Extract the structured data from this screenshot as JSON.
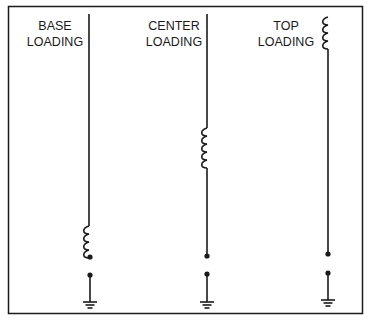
{
  "diagram": {
    "type": "antenna-loading-comparison",
    "colors": {
      "ink": "#1a1a1a",
      "background": "#ffffff"
    },
    "antennas": [
      {
        "id": "base",
        "label_lines": [
          "BASE",
          "LOADING"
        ],
        "coil_position": "base"
      },
      {
        "id": "center",
        "label_lines": [
          "CENTER",
          "LOADING"
        ],
        "coil_position": "center"
      },
      {
        "id": "top",
        "label_lines": [
          "TOP",
          "LOADING"
        ],
        "coil_position": "top"
      }
    ]
  }
}
